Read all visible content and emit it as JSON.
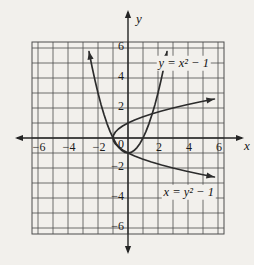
{
  "figure": {
    "bg_color": "#f2f0ec",
    "grid_color": "#4d4d4d",
    "axis_color": "#242424",
    "curve_color": "#2c2c2c",
    "text_color": "#141414"
  },
  "axes": {
    "x_label": "x",
    "y_label": "y",
    "origin_label": "0"
  },
  "chart_data": {
    "type": "line",
    "title": "",
    "xlabel": "x",
    "ylabel": "y",
    "xlim": [
      -6,
      6
    ],
    "ylim": [
      -6,
      6
    ],
    "grid": true,
    "grid_step": 1,
    "grid_margin": 0.4,
    "legend_position": "none",
    "x_ticks": [
      {
        "v": -6,
        "label": "−6"
      },
      {
        "v": -4,
        "label": "−4"
      },
      {
        "v": -2,
        "label": "−2"
      },
      {
        "v": 2,
        "label": "2"
      },
      {
        "v": 4,
        "label": "4"
      },
      {
        "v": 6,
        "label": "6"
      }
    ],
    "y_ticks": [
      {
        "v": 6,
        "label": "6"
      },
      {
        "v": 4,
        "label": "4"
      },
      {
        "v": 2,
        "label": "2"
      },
      {
        "v": -2,
        "label": "−2"
      },
      {
        "v": -4,
        "label": "−4"
      },
      {
        "v": -6,
        "label": "−6"
      }
    ],
    "series": [
      {
        "name": "y = x² − 1",
        "equation": "y = x^2 - 1",
        "vertex": [
          0,
          -1
        ],
        "x_intercepts": [
          [
            -1,
            0
          ],
          [
            1,
            0
          ]
        ],
        "arrows": "both-ends",
        "label_pos": [
          3.72,
          5.0
        ],
        "points": [
          [
            -2.6,
            5.76
          ],
          [
            -2.4,
            4.76
          ],
          [
            -2.2,
            3.84
          ],
          [
            -2,
            3
          ],
          [
            -1.8,
            2.24
          ],
          [
            -1.6,
            1.56
          ],
          [
            -1.4,
            0.96
          ],
          [
            -1.2,
            0.44
          ],
          [
            -1,
            0
          ],
          [
            -0.8,
            -0.36
          ],
          [
            -0.6,
            -0.64
          ],
          [
            -0.4,
            -0.84
          ],
          [
            -0.2,
            -0.96
          ],
          [
            0,
            -1
          ],
          [
            0.2,
            -0.96
          ],
          [
            0.4,
            -0.84
          ],
          [
            0.6,
            -0.64
          ],
          [
            0.8,
            -0.36
          ],
          [
            1,
            0
          ],
          [
            1.2,
            0.44
          ],
          [
            1.4,
            0.96
          ],
          [
            1.6,
            1.56
          ],
          [
            1.8,
            2.24
          ],
          [
            2,
            3
          ],
          [
            2.2,
            3.84
          ],
          [
            2.4,
            4.76
          ],
          [
            2.6,
            5.76
          ]
        ]
      },
      {
        "name": "x = y² − 1",
        "equation": "x = y^2 - 1",
        "vertex": [
          -1,
          0
        ],
        "y_intercepts": [
          [
            0,
            -1
          ],
          [
            0,
            1
          ]
        ],
        "arrows": "both-ends",
        "label_pos": [
          4.05,
          -3.62
        ],
        "points": [
          [
            5.76,
            -2.6
          ],
          [
            4.76,
            -2.4
          ],
          [
            3.84,
            -2.2
          ],
          [
            3,
            -2
          ],
          [
            2.24,
            -1.8
          ],
          [
            1.56,
            -1.6
          ],
          [
            0.96,
            -1.4
          ],
          [
            0.44,
            -1.2
          ],
          [
            0,
            -1
          ],
          [
            -0.36,
            -0.8
          ],
          [
            -0.64,
            -0.6
          ],
          [
            -0.84,
            -0.4
          ],
          [
            -0.96,
            -0.2
          ],
          [
            -1,
            0
          ],
          [
            -0.96,
            0.2
          ],
          [
            -0.84,
            0.4
          ],
          [
            -0.64,
            0.6
          ],
          [
            -0.36,
            0.8
          ],
          [
            0,
            1
          ],
          [
            0.44,
            1.2
          ],
          [
            0.96,
            1.4
          ],
          [
            1.56,
            1.6
          ],
          [
            2.24,
            1.8
          ],
          [
            3,
            2
          ],
          [
            3.84,
            2.2
          ],
          [
            4.76,
            2.4
          ],
          [
            5.76,
            2.6
          ]
        ]
      }
    ]
  }
}
